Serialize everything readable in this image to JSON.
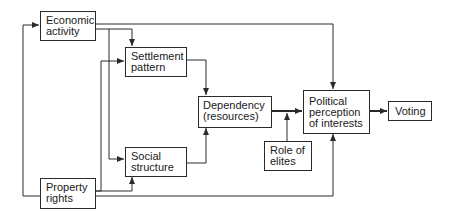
{
  "diagram": {
    "type": "flow-diagram",
    "nodes": {
      "economic_activity": {
        "line1": "Economic",
        "line2": "activity"
      },
      "property_rights": {
        "line1": "Property",
        "line2": "rights"
      },
      "settlement_pattern": {
        "line1": "Settlement",
        "line2": "pattern"
      },
      "social_structure": {
        "line1": "Social",
        "line2": "structure"
      },
      "dependency": {
        "line1": "Dependency",
        "line2": "(resources)"
      },
      "role_of_elites": {
        "line1": "Role of",
        "line2": "elites"
      },
      "political_perception": {
        "line1": "Political",
        "line2": "perception",
        "line3": "of interests"
      },
      "voting": {
        "line1": "Voting"
      }
    },
    "edges": [
      {
        "from": "Economic activity",
        "to": "Settlement pattern"
      },
      {
        "from": "Economic activity",
        "to": "Social structure"
      },
      {
        "from": "Economic activity",
        "to": "Political perception of interests"
      },
      {
        "from": "Property rights",
        "to": "Settlement pattern"
      },
      {
        "from": "Property rights",
        "to": "Social structure"
      },
      {
        "from": "Property rights",
        "to": "Political perception of interests"
      },
      {
        "from": "Property rights",
        "to": "Economic activity"
      },
      {
        "from": "Settlement pattern",
        "to": "Dependency (resources)"
      },
      {
        "from": "Social structure",
        "to": "Dependency (resources)"
      },
      {
        "from": "Dependency (resources)",
        "to": "Political perception of interests"
      },
      {
        "from": "Role of elites",
        "to": "Dependency → Political link"
      },
      {
        "from": "Political perception of interests",
        "to": "Voting"
      }
    ],
    "colors": {
      "line": "#2a2a2a",
      "background": "#ffffff"
    }
  }
}
